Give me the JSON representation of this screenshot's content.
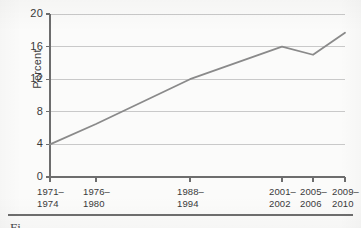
{
  "chart_data": {
    "type": "line",
    "title": "",
    "xlabel": "",
    "ylabel": "Percent",
    "ylim": [
      0,
      20
    ],
    "yticks": [
      0,
      4,
      8,
      12,
      16,
      20
    ],
    "ytick_labels": [
      "0",
      "4",
      "8",
      "12",
      "16",
      "20"
    ],
    "grid": true,
    "grid_axis": "y",
    "legend": "none",
    "categories": [
      "1971–1974",
      "1976–1980",
      "1988–1994",
      "2001–2002",
      "2005–2006",
      "2009–2010"
    ],
    "category_lines": [
      [
        "1971–",
        "1974"
      ],
      [
        "1976–",
        "1980"
      ],
      [
        "1988–",
        "1994"
      ],
      [
        "2001–",
        "2002"
      ],
      [
        "2005–",
        "2006"
      ],
      [
        "2009–",
        "2010"
      ]
    ],
    "values": [
      4.0,
      6.5,
      12.0,
      16.0,
      15.0,
      17.7
    ],
    "series": [
      {
        "name": "Percent",
        "values": [
          4.0,
          6.5,
          12.0,
          16.0,
          15.0,
          17.7
        ],
        "color": "#8a8a8a"
      }
    ]
  },
  "caption": {
    "text": "Fi"
  },
  "colors": {
    "line": "#8a8a8a",
    "grid": "#c9c9c9",
    "axis": "#6d6d6d",
    "text": "#3a3a3a",
    "background": "#fbfbfa"
  }
}
